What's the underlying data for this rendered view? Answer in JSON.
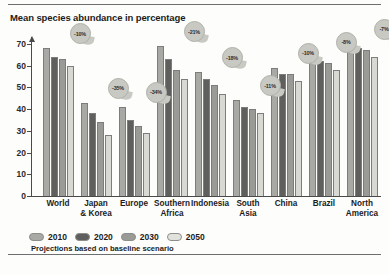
{
  "figure": {
    "title": "Mean species abundance in percentage",
    "footnote": "Projections based on baseline scenario"
  },
  "chart_data": {
    "type": "bar",
    "title": "Mean species abundance in percentage",
    "xlabel": "",
    "ylabel": "Mean species abundance in percentage",
    "ylim": [
      0,
      75
    ],
    "yticks": [
      0,
      10,
      20,
      30,
      40,
      50,
      60,
      70
    ],
    "grid": false,
    "legend_position": "bottom-left",
    "categories": [
      "World",
      "Japan & Korea",
      "Europe",
      "Southern Africa",
      "Indonesia",
      "South Asia",
      "China",
      "Brazil",
      "North America"
    ],
    "category_lines": [
      [
        "World"
      ],
      [
        "Japan",
        "& Korea"
      ],
      [
        "Europe"
      ],
      [
        "Southern",
        "Africa"
      ],
      [
        "Indonesia"
      ],
      [
        "South",
        "Asia"
      ],
      [
        "China"
      ],
      [
        "Brazil"
      ],
      [
        "North",
        "America"
      ]
    ],
    "series": [
      {
        "name": "2010",
        "color": "#a8a8a4",
        "values": [
          68,
          43,
          41,
          69,
          57,
          44,
          59,
          64,
          70
        ]
      },
      {
        "name": "2020",
        "color": "#5f5f5d",
        "values": [
          64,
          38,
          35,
          63,
          54,
          41,
          56,
          62,
          68
        ]
      },
      {
        "name": "2030",
        "color": "#9a9a97",
        "values": [
          63,
          34,
          32,
          58,
          51,
          40,
          56,
          61,
          67
        ]
      },
      {
        "name": "2050",
        "color": "#d9d9d4",
        "values": [
          60,
          28,
          29,
          54,
          47,
          38,
          53,
          58,
          64
        ]
      }
    ],
    "annotations": [
      {
        "category": "World",
        "label": "-10%"
      },
      {
        "category": "Japan & Korea",
        "label": "-35%"
      },
      {
        "category": "Europe",
        "label": "-34%"
      },
      {
        "category": "Southern Africa",
        "label": "-21%"
      },
      {
        "category": "Indonesia",
        "label": "-18%"
      },
      {
        "category": "South Asia",
        "label": "-11%"
      },
      {
        "category": "China",
        "label": "-10%"
      },
      {
        "category": "Brazil",
        "label": "-8%"
      },
      {
        "category": "North America",
        "label": "-7%"
      }
    ]
  }
}
